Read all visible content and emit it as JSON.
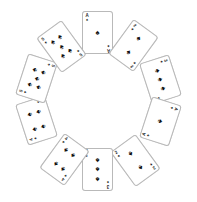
{
  "scene": {
    "title": "Circular arrangement of playing cards",
    "background_color": "#ffffff",
    "card_face_color": "#ffffff",
    "card_border_color": "#b9b9b9",
    "pip_color": "#111111",
    "width": 197,
    "height": 202,
    "card_count": 10,
    "suit_symbol": "♠",
    "suit_name": "spades",
    "center_x": 98,
    "center_y": 101,
    "radius": 62
  },
  "cards": [
    {
      "id": "card-1",
      "position_label": "12-oclock",
      "rank": "A",
      "rank_name": "Ace",
      "suit": "♠",
      "suit_name": "spades",
      "pip_count": 1,
      "orientation": "portrait",
      "rotation_deg": 0,
      "x": 82,
      "y": 11,
      "pips": [
        [
          50,
          50
        ]
      ]
    },
    {
      "id": "card-2",
      "position_label": "1-oclock",
      "rank": "2",
      "rank_name": "Two",
      "suit": "♠",
      "suit_name": "spades",
      "pip_count": 2,
      "orientation": "portrait",
      "rotation_deg": 36,
      "x": 118,
      "y": 24,
      "pips": [
        [
          50,
          22
        ],
        [
          50,
          78
        ]
      ]
    },
    {
      "id": "card-3",
      "position_label": "2-oclock",
      "rank": "3",
      "rank_name": "Three",
      "suit": "♠",
      "suit_name": "spades",
      "pip_count": 3,
      "orientation": "landscape",
      "rotation_deg": 72,
      "x": 139,
      "y": 64,
      "pips": [
        [
          20,
          50
        ],
        [
          50,
          50
        ],
        [
          80,
          50
        ]
      ]
    },
    {
      "id": "card-4",
      "position_label": "4-oclock",
      "rank": "A",
      "rank_name": "Ace",
      "suit": "♠",
      "suit_name": "spades",
      "pip_count": 1,
      "orientation": "landscape",
      "rotation_deg": 108,
      "x": 139,
      "y": 106,
      "pips": [
        [
          50,
          50
        ]
      ]
    },
    {
      "id": "card-5",
      "position_label": "5-oclock",
      "rank": "2",
      "rank_name": "Two",
      "suit": "♠",
      "suit_name": "spades",
      "pip_count": 2,
      "orientation": "portrait",
      "rotation_deg": 144,
      "x": 120,
      "y": 139,
      "pips": [
        [
          50,
          22
        ],
        [
          50,
          78
        ]
      ]
    },
    {
      "id": "card-6",
      "position_label": "6-oclock",
      "rank": "3",
      "rank_name": "Three",
      "suit": "♠",
      "suit_name": "spades",
      "pip_count": 3,
      "orientation": "portrait",
      "rotation_deg": 180,
      "x": 82,
      "y": 148,
      "pips": [
        [
          50,
          20
        ],
        [
          50,
          50
        ],
        [
          50,
          80
        ]
      ]
    },
    {
      "id": "card-7",
      "position_label": "7-oclock",
      "rank": "4",
      "rank_name": "Four",
      "suit": "♠",
      "suit_name": "spades",
      "pip_count": 4,
      "orientation": "portrait",
      "rotation_deg": 216,
      "x": 49,
      "y": 138,
      "pips": [
        [
          27,
          22
        ],
        [
          73,
          22
        ],
        [
          27,
          78
        ],
        [
          73,
          78
        ]
      ]
    },
    {
      "id": "card-8",
      "position_label": "8-oclock",
      "rank": "4",
      "rank_name": "Four",
      "suit": "♠",
      "suit_name": "spades",
      "pip_count": 4,
      "orientation": "landscape",
      "rotation_deg": 252,
      "x": 15,
      "y": 105,
      "pips": [
        [
          25,
          25
        ],
        [
          75,
          25
        ],
        [
          25,
          75
        ],
        [
          75,
          75
        ]
      ]
    },
    {
      "id": "card-9",
      "position_label": "9-oclock",
      "rank": "5",
      "rank_name": "Five",
      "suit": "♠",
      "suit_name": "spades",
      "pip_count": 5,
      "orientation": "landscape",
      "rotation_deg": 288,
      "x": 15,
      "y": 63,
      "pips": [
        [
          25,
          25
        ],
        [
          75,
          25
        ],
        [
          50,
          50
        ],
        [
          25,
          75
        ],
        [
          75,
          75
        ]
      ]
    },
    {
      "id": "card-10",
      "position_label": "11-oclock",
      "rank": "5",
      "rank_name": "Five",
      "suit": "♠",
      "suit_name": "spades",
      "pip_count": 5,
      "orientation": "portrait",
      "rotation_deg": 324,
      "x": 46,
      "y": 25,
      "pips": [
        [
          27,
          22
        ],
        [
          73,
          22
        ],
        [
          50,
          50
        ],
        [
          27,
          78
        ],
        [
          73,
          78
        ]
      ]
    }
  ]
}
